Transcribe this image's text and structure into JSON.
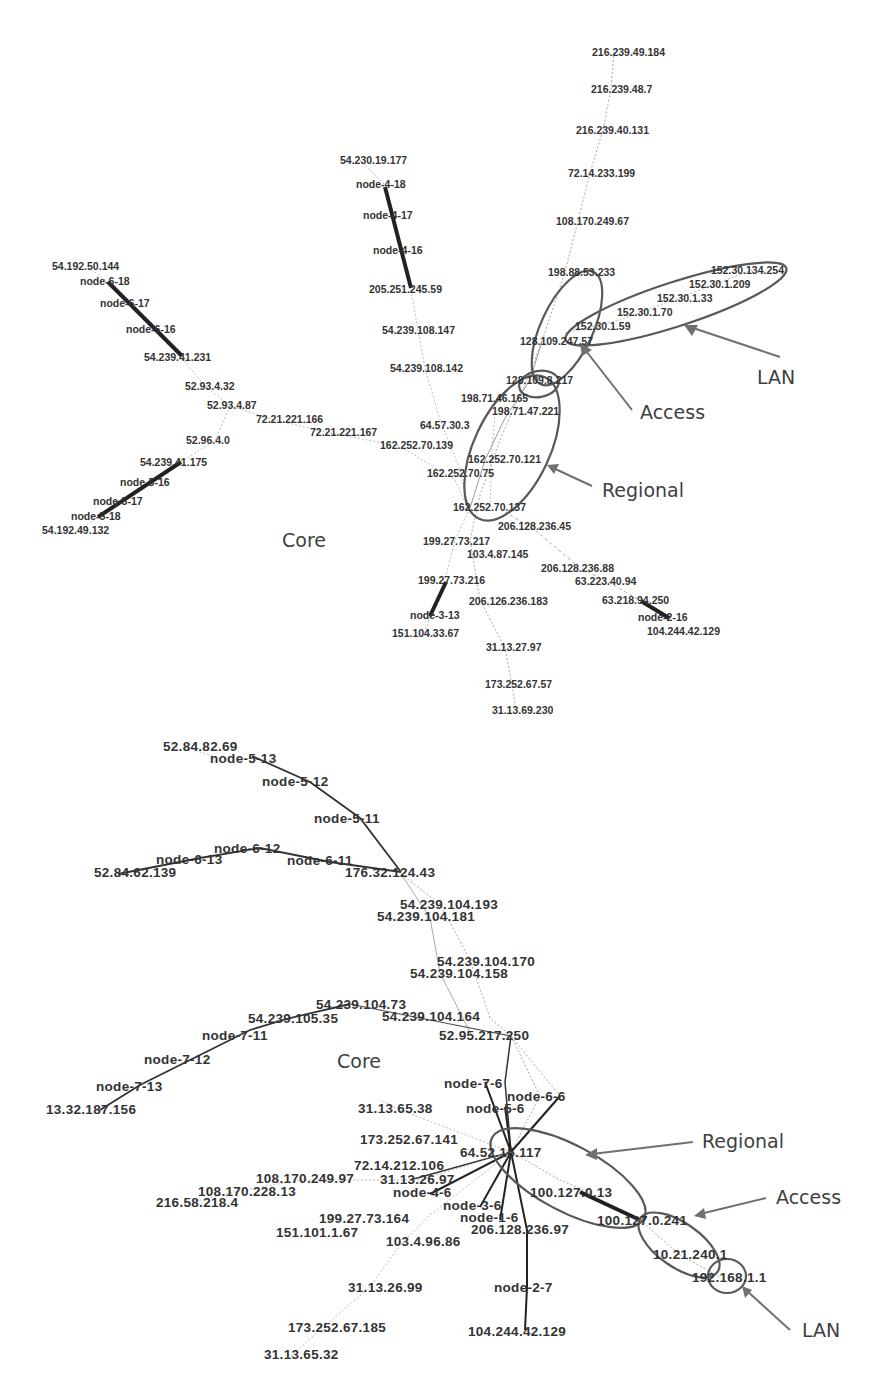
{
  "figure": {
    "top_graph": {
      "labels": [
        {
          "text": "216.239.49.184",
          "x": 592,
          "y": 56
        },
        {
          "text": "216.239.48.7",
          "x": 591,
          "y": 93
        },
        {
          "text": "216.239.40.131",
          "x": 576,
          "y": 134
        },
        {
          "text": "72.14.233.199",
          "x": 568,
          "y": 177
        },
        {
          "text": "108.170.249.67",
          "x": 556,
          "y": 225
        },
        {
          "text": "54.230.19.177",
          "x": 340,
          "y": 164
        },
        {
          "text": "node-4-18",
          "x": 356,
          "y": 188
        },
        {
          "text": "node-4-17",
          "x": 363,
          "y": 219
        },
        {
          "text": "node-4-16",
          "x": 373,
          "y": 254
        },
        {
          "text": "205.251.245.59",
          "x": 369,
          "y": 293
        },
        {
          "text": "54.239.108.147",
          "x": 382,
          "y": 334
        },
        {
          "text": "54.239.108.142",
          "x": 390,
          "y": 372
        },
        {
          "text": "54.192.50.144",
          "x": 52,
          "y": 270
        },
        {
          "text": "node-6-18",
          "x": 80,
          "y": 285
        },
        {
          "text": "node-6-17",
          "x": 100,
          "y": 307
        },
        {
          "text": "node-6-16",
          "x": 126,
          "y": 333
        },
        {
          "text": "54.239.41.231",
          "x": 144,
          "y": 361
        },
        {
          "text": "52.93.4.32",
          "x": 185,
          "y": 390
        },
        {
          "text": "52.93.4.87",
          "x": 207,
          "y": 409
        },
        {
          "text": "72.21.221.166",
          "x": 256,
          "y": 423
        },
        {
          "text": "72.21.221.167",
          "x": 310,
          "y": 436
        },
        {
          "text": "52.96.4.0",
          "x": 186,
          "y": 444
        },
        {
          "text": "54.239.41.175",
          "x": 140,
          "y": 466
        },
        {
          "text": "node-5-16",
          "x": 120,
          "y": 486
        },
        {
          "text": "node-5-17",
          "x": 93,
          "y": 505
        },
        {
          "text": "node-5-18",
          "x": 71,
          "y": 520
        },
        {
          "text": "54.192.49.132",
          "x": 42,
          "y": 534
        },
        {
          "text": "198.88.53.233",
          "x": 548,
          "y": 276
        },
        {
          "text": "152.30.134.254",
          "x": 711,
          "y": 274
        },
        {
          "text": "152.30.1.209",
          "x": 689,
          "y": 288
        },
        {
          "text": "152.30.1.33",
          "x": 657,
          "y": 302
        },
        {
          "text": "152.30.1.70",
          "x": 617,
          "y": 316
        },
        {
          "text": "152.30.1.59",
          "x": 575,
          "y": 330
        },
        {
          "text": "128.109.247.57",
          "x": 520,
          "y": 345
        },
        {
          "text": "128.109.8.217",
          "x": 506,
          "y": 384
        },
        {
          "text": "198.71.46.165",
          "x": 461,
          "y": 402
        },
        {
          "text": "198.71.47.221",
          "x": 492,
          "y": 415
        },
        {
          "text": "64.57.30.3",
          "x": 420,
          "y": 429
        },
        {
          "text": "162.252.70.139",
          "x": 380,
          "y": 449
        },
        {
          "text": "162.252.70.121",
          "x": 468,
          "y": 463
        },
        {
          "text": "162.252.70.75",
          "x": 427,
          "y": 477
        },
        {
          "text": "162.252.70.137",
          "x": 453,
          "y": 511
        },
        {
          "text": "206.128.236.45",
          "x": 498,
          "y": 530
        },
        {
          "text": "199.27.73.217",
          "x": 423,
          "y": 545
        },
        {
          "text": "103.4.87.145",
          "x": 467,
          "y": 558
        },
        {
          "text": "206.128.236.88",
          "x": 541,
          "y": 572
        },
        {
          "text": "63.223.40.94",
          "x": 575,
          "y": 585
        },
        {
          "text": "199.27.73.216",
          "x": 418,
          "y": 584
        },
        {
          "text": "206.126.236.183",
          "x": 469,
          "y": 605
        },
        {
          "text": "63.218.94.250",
          "x": 602,
          "y": 604
        },
        {
          "text": "node-3-13",
          "x": 410,
          "y": 619
        },
        {
          "text": "node-2-16",
          "x": 638,
          "y": 621
        },
        {
          "text": "151.104.33.67",
          "x": 392,
          "y": 637
        },
        {
          "text": "104.244.42.129",
          "x": 647,
          "y": 635
        },
        {
          "text": "31.13.27.97",
          "x": 486,
          "y": 651
        },
        {
          "text": "173.252.67.57",
          "x": 485,
          "y": 688
        },
        {
          "text": "31.13.69.230",
          "x": 492,
          "y": 714
        }
      ],
      "annotations": [
        {
          "text": "LAN",
          "x": 757,
          "y": 384
        },
        {
          "text": "Access",
          "x": 640,
          "y": 419
        },
        {
          "text": "Regional",
          "x": 602,
          "y": 497
        },
        {
          "text": "Core",
          "x": 282,
          "y": 547
        }
      ]
    },
    "bottom_graph": {
      "labels": [
        {
          "text": "52.84.82.69",
          "x": 163,
          "y": 751
        },
        {
          "text": "node-5-13",
          "x": 210,
          "y": 763
        },
        {
          "text": "node-5-12",
          "x": 262,
          "y": 786
        },
        {
          "text": "node-5-11",
          "x": 314,
          "y": 823
        },
        {
          "text": "node-6-12",
          "x": 214,
          "y": 853
        },
        {
          "text": "node-6-13",
          "x": 156,
          "y": 864
        },
        {
          "text": "node-6-11",
          "x": 287,
          "y": 865
        },
        {
          "text": "52.84.62.139",
          "x": 94,
          "y": 877
        },
        {
          "text": "176.32.124.43",
          "x": 345,
          "y": 877
        },
        {
          "text": "54.239.104.193",
          "x": 400,
          "y": 909
        },
        {
          "text": "54.239.104.181",
          "x": 377,
          "y": 921
        },
        {
          "text": "54.239.104.170",
          "x": 437,
          "y": 966
        },
        {
          "text": "54.239.104.158",
          "x": 410,
          "y": 978
        },
        {
          "text": "54.239.104.73",
          "x": 316,
          "y": 1009
        },
        {
          "text": "54.239.105.35",
          "x": 248,
          "y": 1023
        },
        {
          "text": "54.239.104.164",
          "x": 382,
          "y": 1021
        },
        {
          "text": "node-7-11",
          "x": 202,
          "y": 1040
        },
        {
          "text": "52.95.217.250",
          "x": 439,
          "y": 1040
        },
        {
          "text": "node-7-12",
          "x": 144,
          "y": 1064
        },
        {
          "text": "node-7-13",
          "x": 96,
          "y": 1091
        },
        {
          "text": "node-7-6",
          "x": 444,
          "y": 1088
        },
        {
          "text": "node-6-6",
          "x": 507,
          "y": 1101
        },
        {
          "text": "13.32.187.156",
          "x": 46,
          "y": 1114
        },
        {
          "text": "31.13.65.38",
          "x": 358,
          "y": 1113
        },
        {
          "text": "node-5-6",
          "x": 466,
          "y": 1113
        },
        {
          "text": "173.252.67.141",
          "x": 360,
          "y": 1144
        },
        {
          "text": "64.52.15.117",
          "x": 460,
          "y": 1157
        },
        {
          "text": "72.14.212.106",
          "x": 354,
          "y": 1170
        },
        {
          "text": "108.170.249.97",
          "x": 256,
          "y": 1183
        },
        {
          "text": "31.13.26.97",
          "x": 380,
          "y": 1184
        },
        {
          "text": "108.170.228.13",
          "x": 198,
          "y": 1196
        },
        {
          "text": "node-4-6",
          "x": 393,
          "y": 1197
        },
        {
          "text": "100.127.0.13",
          "x": 530,
          "y": 1197
        },
        {
          "text": "216.58.218.4",
          "x": 156,
          "y": 1207
        },
        {
          "text": "node-3-6",
          "x": 443,
          "y": 1210
        },
        {
          "text": "100.127.0.241",
          "x": 597,
          "y": 1225
        },
        {
          "text": "node-1-6",
          "x": 460,
          "y": 1222
        },
        {
          "text": "199.27.73.164",
          "x": 319,
          "y": 1223
        },
        {
          "text": "206.128.236.97",
          "x": 471,
          "y": 1234
        },
        {
          "text": "151.101.1.67",
          "x": 276,
          "y": 1237
        },
        {
          "text": "103.4.96.86",
          "x": 386,
          "y": 1246
        },
        {
          "text": "10.21.240.1",
          "x": 653,
          "y": 1259
        },
        {
          "text": "192.168.1.1",
          "x": 692,
          "y": 1282
        },
        {
          "text": "31.13.26.99",
          "x": 348,
          "y": 1292
        },
        {
          "text": "node-2-7",
          "x": 494,
          "y": 1292
        },
        {
          "text": "173.252.67.185",
          "x": 288,
          "y": 1332
        },
        {
          "text": "104.244.42.129",
          "x": 468,
          "y": 1336
        },
        {
          "text": "31.13.65.32",
          "x": 264,
          "y": 1359
        }
      ],
      "annotations": [
        {
          "text": "Regional",
          "x": 702,
          "y": 1148
        },
        {
          "text": "Core",
          "x": 337,
          "y": 1068
        },
        {
          "text": "Access",
          "x": 776,
          "y": 1204
        },
        {
          "text": "LAN",
          "x": 802,
          "y": 1337
        }
      ]
    }
  }
}
